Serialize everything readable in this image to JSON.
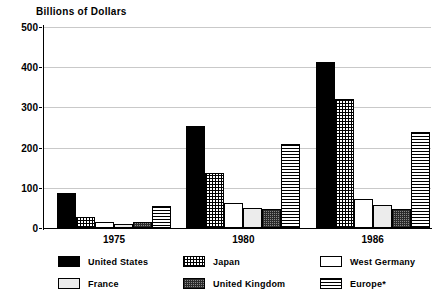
{
  "chart_data": {
    "type": "bar",
    "title": "Billions of Dollars",
    "xlabel": "",
    "ylabel": "Billions of Dollars",
    "ylim": [
      0,
      500
    ],
    "yticks": [
      0,
      100,
      200,
      300,
      400,
      500
    ],
    "ytick_labels": [
      "0",
      "100",
      "200",
      "300",
      "400",
      "500"
    ],
    "grid": true,
    "legend_position": "bottom",
    "categories": [
      "1975",
      "1980",
      "1986"
    ],
    "series": [
      {
        "name": "United States",
        "values": [
          88,
          255,
          412
        ],
        "pattern": "solid-black",
        "color": "#000000"
      },
      {
        "name": "Japan",
        "values": [
          27,
          137,
          320
        ],
        "pattern": "check-light",
        "color": "#c0c0c0"
      },
      {
        "name": "West Germany",
        "values": [
          15,
          63,
          72
        ],
        "pattern": "white",
        "color": "#ffffff"
      },
      {
        "name": "France",
        "values": [
          10,
          50,
          57
        ],
        "pattern": "light-gray",
        "color": "#ececec"
      },
      {
        "name": "United Kingdom",
        "values": [
          14,
          48,
          48
        ],
        "pattern": "check-dark",
        "color": "#8a8a8a"
      },
      {
        "name": "Europe*",
        "values": [
          55,
          210,
          238
        ],
        "pattern": "h-stripe",
        "color": "#ffffff"
      }
    ]
  },
  "legend": {
    "items": [
      {
        "label": "United States",
        "pattern": "solid-black"
      },
      {
        "label": "Japan",
        "pattern": "check-light"
      },
      {
        "label": "West Germany",
        "pattern": "white"
      },
      {
        "label": "France",
        "pattern": "light-gray"
      },
      {
        "label": "United Kingdom",
        "pattern": "check-dark"
      },
      {
        "label": "Europe*",
        "pattern": "h-stripe"
      }
    ]
  },
  "colors": {
    "axis": "#000000",
    "gridline": "#c9c9c9",
    "background": "#ffffff"
  }
}
